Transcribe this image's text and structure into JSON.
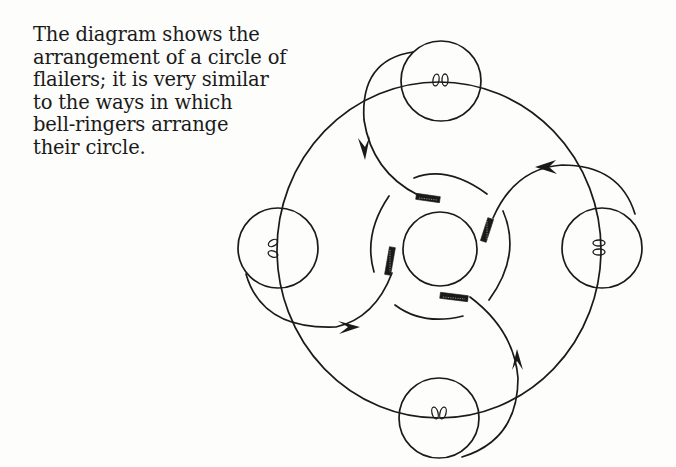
{
  "caption": {
    "lines": [
      "The diagram shows the",
      "arrangement of a circle of",
      "flailers; it is very similar",
      "to the ways in which",
      "bell-ringers arrange",
      "their circle."
    ]
  },
  "diagram": {
    "stroke_color": "#1a1a1a",
    "background": "#fdfdfc",
    "flailers": [
      {
        "position": "top",
        "label": "flailer-top"
      },
      {
        "position": "right",
        "label": "flailer-right"
      },
      {
        "position": "bottom",
        "label": "flailer-bottom"
      },
      {
        "position": "left",
        "label": "flailer-left"
      }
    ],
    "elements": [
      "outer-circle-path",
      "center-circle-threshing-floor",
      "four-swing-arcs-with-arrows",
      "four-flail-heads",
      "four-inner-guide-arcs"
    ]
  }
}
